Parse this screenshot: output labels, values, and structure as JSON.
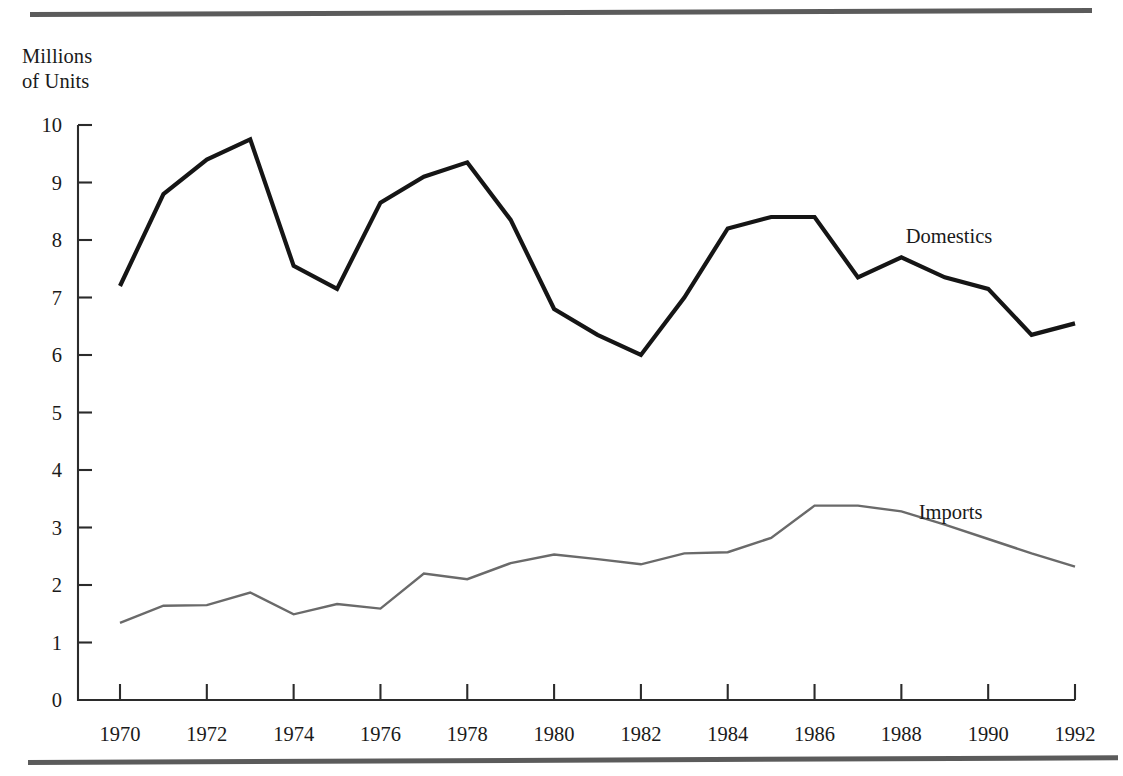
{
  "figure": {
    "axis_title": "Millions\nof Units",
    "top_rule": "horizontal-rule",
    "bottom_rule": "horizontal-rule"
  },
  "chart_data": {
    "type": "line",
    "title": "",
    "subtitle": "",
    "xlabel": "",
    "ylabel": "Millions of Units",
    "xlim": [
      1969,
      1992
    ],
    "ylim": [
      0,
      10
    ],
    "grid": false,
    "legend": "inline-right",
    "x": [
      1970,
      1971,
      1972,
      1973,
      1974,
      1975,
      1976,
      1977,
      1978,
      1979,
      1980,
      1981,
      1982,
      1983,
      1984,
      1985,
      1986,
      1987,
      1988,
      1989,
      1990,
      1991,
      1992
    ],
    "x_tick_labels": [
      "1970",
      "1972",
      "1974",
      "1976",
      "1978",
      "1980",
      "1982",
      "1984",
      "1986",
      "1988",
      "1990",
      "1992"
    ],
    "x_ticks": [
      1970,
      1972,
      1974,
      1976,
      1978,
      1980,
      1982,
      1984,
      1986,
      1988,
      1990,
      1992
    ],
    "y_tick_labels": [
      "0",
      "1",
      "2",
      "3",
      "4",
      "5",
      "6",
      "7",
      "8",
      "9",
      "10"
    ],
    "y_ticks": [
      0,
      1,
      2,
      3,
      4,
      5,
      6,
      7,
      8,
      9,
      10
    ],
    "series": [
      {
        "name": "Domestics",
        "color": "#151515",
        "width": 4.2,
        "label_x": 1988.1,
        "label_y": 7.95,
        "values": [
          7.2,
          8.8,
          9.4,
          9.75,
          7.55,
          7.15,
          8.65,
          9.1,
          9.35,
          8.35,
          6.8,
          6.35,
          6.0,
          7.0,
          8.2,
          8.4,
          8.4,
          7.35,
          7.7,
          7.35,
          7.15,
          6.35,
          6.55
        ]
      },
      {
        "name": "Imports",
        "color": "#6a6a6a",
        "width": 2.4,
        "label_x": 1988.4,
        "label_y": 3.15,
        "values": [
          1.34,
          1.64,
          1.65,
          1.87,
          1.49,
          1.67,
          1.59,
          2.2,
          2.1,
          2.38,
          2.53,
          2.45,
          2.36,
          2.55,
          2.57,
          2.82,
          3.38,
          3.38,
          3.28,
          3.05,
          2.8,
          2.55,
          2.32
        ]
      }
    ]
  }
}
